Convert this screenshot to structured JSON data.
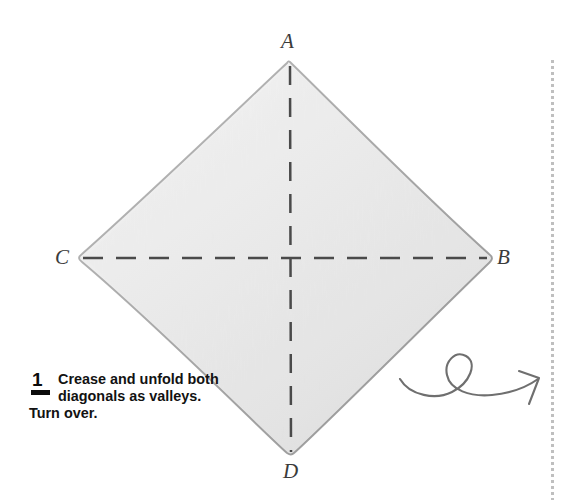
{
  "figure": {
    "paper": {
      "shape": "square-rotated-45",
      "fill_light": "#f4f4f4",
      "fill_mid": "#e9e9e9",
      "fill_dark": "#d8d8d8",
      "edge_color": "#9a9a9a",
      "vertices": {
        "top": {
          "x": 290,
          "y": 62
        },
        "right": {
          "x": 492,
          "y": 258
        },
        "bottom": {
          "x": 291,
          "y": 455
        },
        "left": {
          "x": 78,
          "y": 258
        }
      }
    },
    "vertex_labels": [
      {
        "id": "A",
        "text": "A",
        "position": "top"
      },
      {
        "id": "B",
        "text": "B",
        "position": "right"
      },
      {
        "id": "C",
        "text": "C",
        "position": "left"
      },
      {
        "id": "D",
        "text": "D",
        "position": "bottom"
      }
    ],
    "crease_lines": [
      {
        "name": "vertical-valley-crease",
        "style": "dashed",
        "color": "#4a4a4a",
        "from": "A",
        "to": "D"
      },
      {
        "name": "horizontal-valley-crease",
        "style": "dashed",
        "color": "#4a4a4a",
        "from": "C",
        "to": "B"
      }
    ],
    "turn_over_symbol": {
      "name": "turn-over-arrow",
      "color": "#6f6f6f",
      "description": "looping flip-over arrow"
    },
    "margin_rule": {
      "name": "page-margin-dotted-rule",
      "color": "#b4b4b4",
      "style": "dotted"
    }
  },
  "caption": {
    "step_number": "1",
    "text": "Crease and unfold both diagonals as valleys. Turn over."
  }
}
